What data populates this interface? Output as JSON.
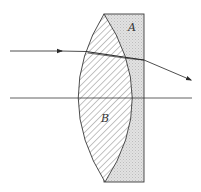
{
  "figure": {
    "labels": {
      "A": "A",
      "B": "B"
    },
    "colors": {
      "line": "#3a3a3a",
      "plate_fill": "#dcdcdc",
      "lens_fill": "#ffffff",
      "hatch": "#6a6a6a"
    },
    "elements": [
      {
        "id": "A",
        "kind": "plano-concave plate",
        "description": "dotted grey rectangular block on the right"
      },
      {
        "id": "B",
        "kind": "biconvex lens",
        "description": "hatched lens with convex left and right faces"
      }
    ],
    "rays": [
      {
        "kind": "incident",
        "direction": "left to right",
        "arrow": true
      },
      {
        "kind": "refracted-internal",
        "description": "ray bends slightly downward through lens and plate"
      },
      {
        "kind": "emergent",
        "direction": "down-right",
        "arrow": true
      }
    ],
    "axis": {
      "kind": "optical axis",
      "orientation": "horizontal"
    }
  }
}
